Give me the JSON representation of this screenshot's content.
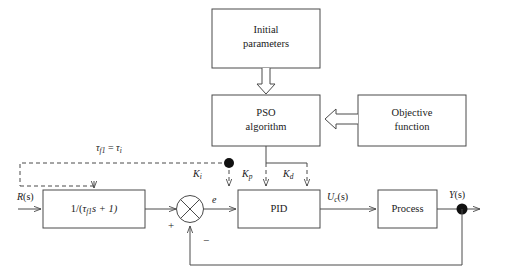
{
  "diagram": {
    "background_color": "#ffffff",
    "line_color": "#4a4a4a",
    "text_color": "#1a1a1a",
    "blocks": {
      "initial_parameters": {
        "line1": "Initial",
        "line2": "parameters"
      },
      "pso_algorithm": {
        "line1": "PSO",
        "line2": "algorithm"
      },
      "objective_function": {
        "line1": "Objective",
        "line2": "function"
      },
      "filter": {
        "text": "1/(",
        "tau": "τ",
        "tau_sub": "f1",
        "rest": "s + 1)"
      },
      "pid": {
        "text": "PID"
      },
      "process": {
        "text": "Process"
      }
    },
    "signals": {
      "input": {
        "base": "R",
        "arg": "(s)"
      },
      "error": {
        "text": "e"
      },
      "control": {
        "base": "U",
        "sub": "c",
        "arg": "(s)"
      },
      "output": {
        "base": "Y",
        "arg": "(s)"
      },
      "gain_i": {
        "base": "K",
        "sub": "i"
      },
      "gain_p": {
        "base": "K",
        "sub": "p"
      },
      "gain_d": {
        "base": "K",
        "sub": "d"
      },
      "tau_relation": {
        "lhs": "τ",
        "lhs_sub": "f1",
        "eq": " = ",
        "rhs": "τ",
        "rhs_sub": "i"
      }
    },
    "sum_junction": {
      "plus": "+",
      "minus": "−"
    }
  }
}
